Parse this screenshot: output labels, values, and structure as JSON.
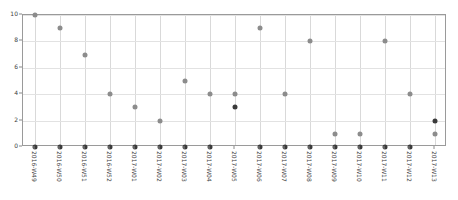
{
  "chart_data": {
    "type": "scatter",
    "title": "",
    "xlabel": "",
    "ylabel": "",
    "ylim": [
      0,
      10
    ],
    "yticks": [
      0,
      2,
      4,
      6,
      8,
      10
    ],
    "grid": true,
    "legend": "none",
    "categories": [
      "2016-W49",
      "2016-W50",
      "2016-W51",
      "2016-W52",
      "2017-W01",
      "2017-W02",
      "2017-W03",
      "2017-W04",
      "2017-W05",
      "2017-W06",
      "2017-W07",
      "2017-W08",
      "2017-W09",
      "2017-W10",
      "2017-W11",
      "2017-W12",
      "2017-W13"
    ],
    "series": [
      {
        "name": "series-dark",
        "color": "#3a3a3a",
        "values": [
          0,
          0,
          0,
          0,
          0,
          0,
          0,
          0,
          3,
          0,
          0,
          0,
          0,
          0,
          0,
          0,
          2
        ]
      },
      {
        "name": "series-light",
        "color": "#8c8c8c",
        "values": [
          10,
          9,
          7,
          4,
          3,
          2,
          5,
          4,
          4,
          9,
          4,
          8,
          1,
          1,
          8,
          4,
          1
        ]
      }
    ]
  }
}
